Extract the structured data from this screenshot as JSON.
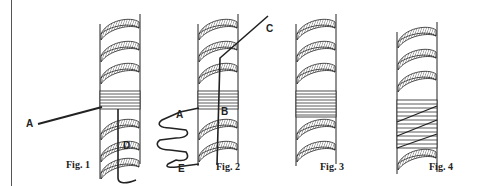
{
  "diagram": {
    "figures": [
      {
        "id": "fig1",
        "caption": "Fig. 1",
        "labels": [
          "A",
          "D"
        ]
      },
      {
        "id": "fig2",
        "caption": "Fig. 2",
        "labels": [
          "A",
          "B",
          "C",
          "E"
        ]
      },
      {
        "id": "fig3",
        "caption": "Fig. 3",
        "labels": []
      },
      {
        "id": "fig4",
        "caption": "Fig. 4",
        "labels": []
      }
    ],
    "labels": {
      "fig1_A": "A",
      "fig1_D": "D",
      "fig2_A": "A",
      "fig2_B": "B",
      "fig2_C": "C",
      "fig2_E": "E"
    },
    "colors": {
      "ink": "#222222",
      "paper": "#ffffff",
      "hatch": "#444444"
    }
  }
}
